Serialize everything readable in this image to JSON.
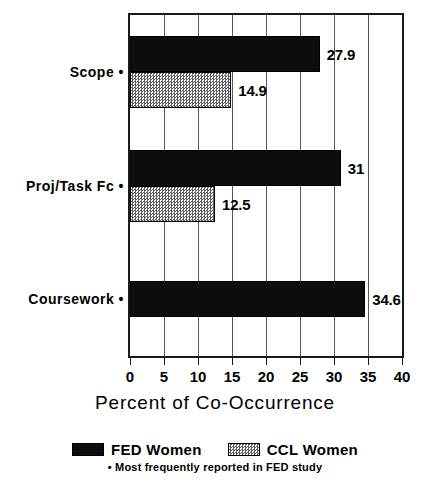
{
  "chart_data": {
    "type": "bar",
    "orientation": "horizontal",
    "title": "",
    "xlabel": "Percent of Co-Occurrence",
    "ylabel": "",
    "xlim": [
      0,
      40
    ],
    "xticks": [
      "0",
      "5",
      "10",
      "15",
      "20",
      "25",
      "30",
      "35",
      "40"
    ],
    "grid": true,
    "legend_position": "bottom",
    "categories": [
      "Scope •",
      "Proj/Task Fc •",
      "Coursework •"
    ],
    "series": [
      {
        "name": "FED Women",
        "color": "#0d0d0d",
        "values": [
          27.9,
          31,
          34.6
        ],
        "labels": [
          "27.9",
          "31",
          "34.6"
        ]
      },
      {
        "name": "CCL Women",
        "color": "#5e5e5e",
        "values": [
          14.9,
          12.5,
          null
        ],
        "labels": [
          "14.9",
          "12.5",
          ""
        ]
      }
    ],
    "footnote": "• Most frequently reported in FED study"
  },
  "legend": {
    "items": [
      {
        "label": "FED Women",
        "swatch": "solid-black"
      },
      {
        "label": "CCL Women",
        "swatch": "hatched-gray"
      }
    ]
  }
}
